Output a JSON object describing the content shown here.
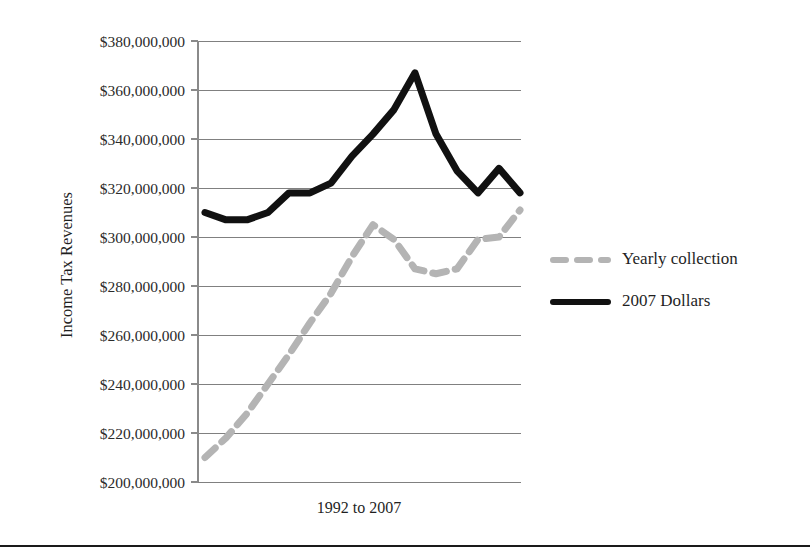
{
  "chart_data": {
    "type": "line",
    "title": "",
    "xlabel": "1992 to 2007",
    "ylabel": "Income Tax Revenues",
    "grid": true,
    "legend_position": "right",
    "ylim": [
      200000000,
      380000000
    ],
    "ytick_labels": [
      "$380,000,000",
      "$360,000,000",
      "$340,000,000",
      "$320,000,000",
      "$300,000,000",
      "$280,000,000",
      "$260,000,000",
      "$240,000,000",
      "$220,000,000",
      "$200,000,000"
    ],
    "ytick_values": [
      380000000,
      360000000,
      340000000,
      320000000,
      300000000,
      280000000,
      260000000,
      240000000,
      220000000,
      200000000
    ],
    "categories": [
      "1992",
      "1993",
      "1994",
      "1995",
      "1996",
      "1997",
      "1998",
      "1999",
      "2000",
      "2001",
      "2002",
      "2003",
      "2004",
      "2005",
      "2006",
      "2007"
    ],
    "xtick_labels": [],
    "series": [
      {
        "name": "Yearly collection",
        "color": "#b4b4b4",
        "style": "dashed",
        "values": [
          210000000,
          218000000,
          228000000,
          240000000,
          252000000,
          265000000,
          277000000,
          292000000,
          305000000,
          299000000,
          287000000,
          285000000,
          287000000,
          299000000,
          300000000,
          311000000
        ]
      },
      {
        "name": "2007 Dollars",
        "color": "#111111",
        "style": "solid",
        "values": [
          310000000,
          307000000,
          307000000,
          310000000,
          318000000,
          318000000,
          322000000,
          333000000,
          342000000,
          352000000,
          367000000,
          342000000,
          327000000,
          318000000,
          328000000,
          318000000
        ]
      }
    ]
  },
  "legend": {
    "items": [
      {
        "label": "Yearly collection",
        "swatch": "dashed-gray-line"
      },
      {
        "label": "2007 Dollars",
        "swatch": "solid-black-line"
      }
    ]
  }
}
